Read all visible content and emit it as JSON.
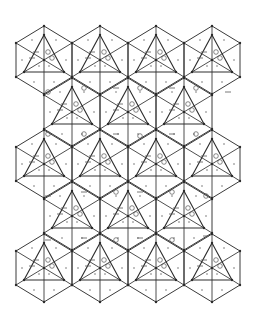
{
  "diagram": {
    "title": "",
    "width": 262,
    "height": 314,
    "colors": {
      "background": "#ffffff",
      "line": "#3a3a3a",
      "mark": "#555555"
    },
    "hex_geometry": {
      "orientation": "pointy-top",
      "half_height": 34,
      "half_width": 28,
      "side_offset_y": 17,
      "triangle": {
        "apex_dy": -25,
        "base_dy": 12,
        "base_half_width": 20
      }
    },
    "rows": [
      {
        "cy": 60,
        "cx": [
          44,
          100,
          156,
          212
        ]
      },
      {
        "cy": 112,
        "cx": [
          72,
          128,
          184
        ]
      },
      {
        "cy": 164,
        "cx": [
          44,
          100,
          156,
          212
        ]
      },
      {
        "cy": 216,
        "cx": [
          72,
          128,
          184
        ]
      },
      {
        "cy": 268,
        "cx": [
          44,
          100,
          156,
          212
        ]
      }
    ],
    "marks_per_tile": [
      {
        "type": "dash",
        "dx": -8,
        "dy": -8
      },
      {
        "type": "circle",
        "dx": 4,
        "dy": -8
      },
      {
        "type": "dash",
        "dx": -12,
        "dy": -2
      },
      {
        "type": "circle",
        "dx": 8,
        "dy": -2
      },
      {
        "type": "dot",
        "dx": -5,
        "dy": 6
      },
      {
        "type": "dot",
        "dx": 5,
        "dy": 6
      },
      {
        "type": "dot",
        "dx": -12,
        "dy": -20
      },
      {
        "type": "dot",
        "dx": 12,
        "dy": -20
      },
      {
        "type": "dot",
        "dx": -22,
        "dy": 0
      },
      {
        "type": "dot",
        "dx": 22,
        "dy": 0
      },
      {
        "type": "dot",
        "dx": -10,
        "dy": 22
      },
      {
        "type": "dot",
        "dx": 10,
        "dy": 22
      }
    ],
    "inter_tile_marks": [
      {
        "type": "circle",
        "x": 48,
        "y": 92
      },
      {
        "type": "circle",
        "x": 84,
        "y": 88
      },
      {
        "type": "dash",
        "x": 116,
        "y": 88
      },
      {
        "type": "circle",
        "x": 140,
        "y": 88
      },
      {
        "type": "circle",
        "x": 196,
        "y": 88
      },
      {
        "type": "dash",
        "x": 172,
        "y": 88
      },
      {
        "type": "dash",
        "x": 228,
        "y": 92
      },
      {
        "type": "circle",
        "x": 48,
        "y": 134
      },
      {
        "type": "circle",
        "x": 84,
        "y": 134
      },
      {
        "type": "dash",
        "x": 116,
        "y": 134
      },
      {
        "type": "circle",
        "x": 140,
        "y": 136
      },
      {
        "type": "circle",
        "x": 196,
        "y": 134
      },
      {
        "type": "dash",
        "x": 172,
        "y": 134
      },
      {
        "type": "dash",
        "x": 48,
        "y": 196
      },
      {
        "type": "dash",
        "x": 84,
        "y": 192
      },
      {
        "type": "circle",
        "x": 116,
        "y": 192
      },
      {
        "type": "dash",
        "x": 140,
        "y": 192
      },
      {
        "type": "circle",
        "x": 172,
        "y": 192
      },
      {
        "type": "circle",
        "x": 206,
        "y": 196
      },
      {
        "type": "dash",
        "x": 48,
        "y": 240
      },
      {
        "type": "dash",
        "x": 84,
        "y": 238
      },
      {
        "type": "circle",
        "x": 116,
        "y": 240
      },
      {
        "type": "dash",
        "x": 140,
        "y": 238
      },
      {
        "type": "circle",
        "x": 172,
        "y": 240
      },
      {
        "type": "dash",
        "x": 206,
        "y": 236
      }
    ]
  }
}
